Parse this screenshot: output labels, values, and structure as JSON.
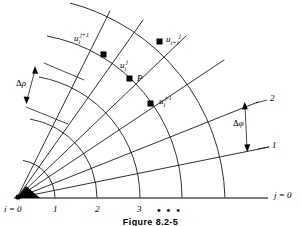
{
  "figure": {
    "caption": "Figure 8.2-5",
    "axis_right_label": {
      "base": "j",
      "eq": " = 0"
    },
    "axis_origin_label": {
      "base": "i",
      "eq": " = 0"
    },
    "bottom_ticks": [
      "1",
      "2",
      "3"
    ],
    "ellipsis": "• • •",
    "ray_labels": [
      "1",
      "2"
    ],
    "spacing_labels": {
      "radial": {
        "symbol": "Δ",
        "var": "ρ"
      },
      "angular": {
        "symbol": "Δ",
        "var": "φ"
      }
    },
    "nodes": [
      {
        "name": "u-i-j-plus-1",
        "base": "u",
        "sub": "i",
        "sup": "j+1"
      },
      {
        "name": "u-i-plus-1-j",
        "base": "u",
        "sub": "i+1",
        "sup": "j"
      },
      {
        "name": "u-i-j",
        "base": "u",
        "sub": "i",
        "sup": "j"
      },
      {
        "name": "u-i-j-minus-1",
        "base": "u",
        "sub": "i",
        "sup": "j-1"
      },
      {
        "name": "point-p",
        "base": "P",
        "sub": "",
        "sup": ""
      }
    ],
    "colors": {
      "line": "#1a1a1a",
      "axis": "#555555",
      "node_fill": "#000000",
      "background": "#ffffff"
    }
  }
}
